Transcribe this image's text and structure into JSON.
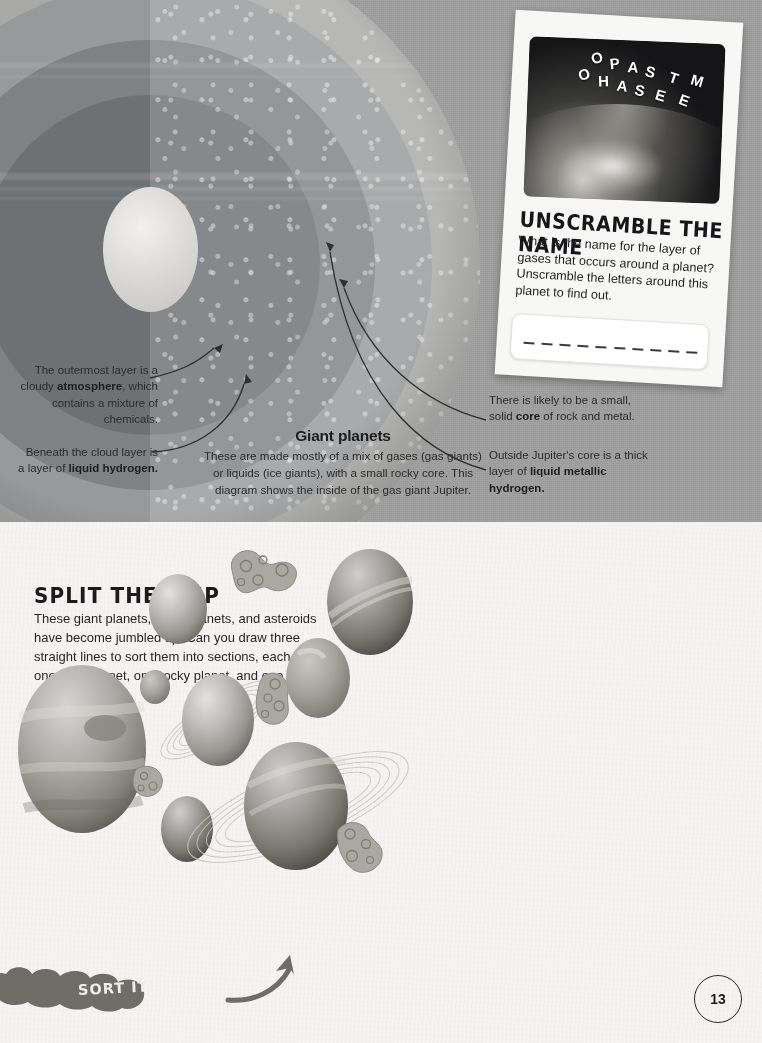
{
  "page": {
    "number": "13",
    "background_grey": "#9d9e9d",
    "background_paper": "#f5f4f2"
  },
  "diagram": {
    "title": "Giant planets",
    "body": "These are made mostly of a mix of gases (gas giants) or liquids (ice giants), with a small rocky core. This diagram shows the inside of the gas giant Jupiter.",
    "annotations": [
      {
        "id": "atmosphere",
        "text_before": "The outermost layer is a cloudy ",
        "bold": "atmosphere",
        "text_after": ", which contains a mixture of chemicals."
      },
      {
        "id": "liquid-hydrogen",
        "text_before": "Beneath the cloud layer is a layer of ",
        "bold": "liquid hydrogen.",
        "text_after": ""
      },
      {
        "id": "core",
        "text_before": "There is likely to be a small, solid ",
        "bold": "core",
        "text_after": " of rock and metal."
      },
      {
        "id": "metallic-hydrogen",
        "text_before": "Outside Jupiter's core is a thick layer of ",
        "bold": "liquid metallic hydrogen.",
        "text_after": ""
      }
    ],
    "layers": [
      "atmosphere",
      "cloud layer",
      "liquid hydrogen",
      "liquid metallic hydrogen",
      "core"
    ]
  },
  "unscramble_card": {
    "title": "UNSCRAMBLE THE NAME",
    "body": "What is the name for the layer of gases that occurs around a planet? Unscramble the letters around this planet to find out.",
    "scrambled_letters_row1": [
      "O",
      "P",
      "A",
      "S",
      "T",
      "M",
      "R"
    ],
    "scrambled_letters_row2": [
      "O",
      "H",
      "A",
      "S",
      "E",
      "E"
    ],
    "answer_blank_count": 10
  },
  "split_activity": {
    "title": "SPLIT THEM UP",
    "body": "These giant planets, rocky planets, and asteroids have become jumbled up. Can you draw three straight lines to sort them into sections, each with one giant planet, one rocky planet, and one asteroid?",
    "badge_label": "SORT IT!",
    "objects": [
      {
        "name": "rocky-planet-small-top",
        "type": "rocky",
        "x": 148,
        "y": 52,
        "w": 58,
        "h": 70
      },
      {
        "name": "asteroid-top",
        "type": "asteroid",
        "x": 230,
        "y": 30,
        "w": 62,
        "h": 44
      },
      {
        "name": "giant-planet-top-right",
        "type": "giant",
        "x": 327,
        "y": 27,
        "w": 86,
        "h": 105
      },
      {
        "name": "rocky-planet-tiny",
        "type": "rocky",
        "x": 140,
        "y": 148,
        "w": 30,
        "h": 34
      },
      {
        "name": "giant-planet-ringed-mid",
        "type": "giant",
        "x": 182,
        "y": 152,
        "w": 72,
        "h": 92
      },
      {
        "name": "asteroid-mid",
        "type": "asteroid",
        "x": 256,
        "y": 152,
        "w": 36,
        "h": 50
      },
      {
        "name": "rocky-planet-mid-right",
        "type": "rocky",
        "x": 296,
        "y": 127,
        "w": 44,
        "h": 58
      },
      {
        "name": "giant-planet-jupiter",
        "type": "giant",
        "x": 18,
        "y": 143,
        "w": 128,
        "h": 168
      },
      {
        "name": "asteroid-left",
        "type": "asteroid",
        "x": 134,
        "y": 240,
        "w": 30,
        "h": 32
      },
      {
        "name": "rocky-planet-bottom",
        "type": "rocky",
        "x": 170,
        "y": 282,
        "w": 34,
        "h": 48
      },
      {
        "name": "giant-planet-saturn",
        "type": "giant",
        "x": 243,
        "y": 218,
        "w": 104,
        "h": 128
      },
      {
        "name": "asteroid-bottom-right",
        "type": "asteroid",
        "x": 332,
        "y": 298,
        "w": 40,
        "h": 48
      }
    ]
  }
}
